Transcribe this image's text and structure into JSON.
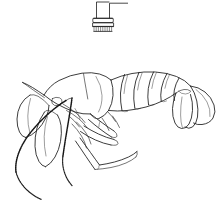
{
  "page": {
    "width": 224,
    "height": 210,
    "background_color": "#ffffff",
    "ink_color": "#1a1a1a",
    "style": "black and white scientific line art / coloring page",
    "caption": ""
  },
  "inset": {
    "name": "appendage tip detail",
    "description": "small detail drawing of a banded appendage tip with setae fringe and a leader line extending to the right",
    "label": "",
    "position": {
      "x": 92,
      "y": 2,
      "width": 40,
      "height": 34
    },
    "parts": [
      {
        "name": "leader-line",
        "description": "horizontal rule extending right from the stalk top"
      },
      {
        "name": "stalk",
        "description": "narrow parallel-sided shaft"
      },
      {
        "name": "collar-bands",
        "description": "three stacked transverse bands forming the cuff"
      },
      {
        "name": "setae-fringe",
        "description": "row of short vertical bristles along the lower margin"
      }
    ]
  },
  "figure": {
    "name": "shrimp-lateral-view",
    "orientation": "facing left",
    "parts": [
      {
        "name": "carapace",
        "label": "",
        "description": "smooth rounded head shield on the upper left"
      },
      {
        "name": "rostrum",
        "label": "",
        "description": "tapering spine projecting forward over the eye"
      },
      {
        "name": "eye-stalk",
        "label": "",
        "description": "short stalked eye below the rostrum base"
      },
      {
        "name": "antennae",
        "label": "",
        "description": "two long stippled flagella sweeping down and left"
      },
      {
        "name": "antennal-scale",
        "label": "",
        "description": "broad leaf-shaped plate beside the antenna base"
      },
      {
        "name": "mouthparts",
        "label": "",
        "description": "overlapping maxillipeds under the head"
      },
      {
        "name": "pereiopods",
        "label": "",
        "description": "jointed walking legs beneath the thorax"
      },
      {
        "name": "chelipeds",
        "label": "",
        "description": "slender pincer-bearing limbs reaching down and right"
      },
      {
        "name": "pleopods",
        "label": "",
        "description": "paired swimmerets under the abdomen"
      },
      {
        "name": "abdomen-segments",
        "label": "",
        "description": "six overlapping pleon segments arcing to the right"
      },
      {
        "name": "telson",
        "label": "",
        "description": "central pointed tail plate"
      },
      {
        "name": "uropods",
        "label": "",
        "description": "three broad fan lobes forming the tail fan"
      }
    ]
  },
  "colors": {
    "background": "#ffffff",
    "line": "#1a1a1a",
    "line_light": "#3a3a3a"
  }
}
